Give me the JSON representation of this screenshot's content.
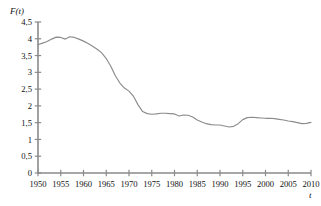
{
  "chart_data": {
    "type": "line",
    "title": "",
    "subtitle": "",
    "xlabel": "t",
    "ylabel": "F(t)",
    "xlim": [
      1950,
      2010
    ],
    "ylim": [
      0,
      4.5
    ],
    "grid": false,
    "legend": null,
    "x_tick_labels": [
      "1950",
      "1955",
      "1960",
      "1965",
      "1970",
      "1975",
      "1980",
      "1985",
      "1990",
      "1995",
      "2000",
      "2005",
      "2010"
    ],
    "x_tick_values": [
      1950,
      1955,
      1960,
      1965,
      1970,
      1975,
      1980,
      1985,
      1990,
      1995,
      2000,
      2005,
      2010
    ],
    "y_tick_labels": [
      "0",
      "0,5",
      "1",
      "1,5",
      "2",
      "2,5",
      "3",
      "3,5",
      "4",
      "4,5"
    ],
    "y_tick_values": [
      0,
      0.5,
      1,
      1.5,
      2,
      2.5,
      3,
      3.5,
      4,
      4.5
    ],
    "decimal_separator": ",",
    "line_color": "#8c8c8c",
    "axis_color": "#8a8a8a",
    "series": [
      {
        "name": "F(t)",
        "x": [
          1950,
          1951,
          1952,
          1953,
          1954,
          1955,
          1956,
          1957,
          1958,
          1959,
          1960,
          1961,
          1962,
          1963,
          1964,
          1965,
          1966,
          1967,
          1968,
          1969,
          1970,
          1971,
          1972,
          1973,
          1974,
          1975,
          1976,
          1977,
          1978,
          1979,
          1980,
          1981,
          1982,
          1983,
          1984,
          1985,
          1986,
          1987,
          1988,
          1989,
          1990,
          1991,
          1992,
          1993,
          1994,
          1995,
          1996,
          1997,
          1998,
          1999,
          2000,
          2001,
          2002,
          2003,
          2004,
          2005,
          2006,
          2007,
          2008,
          2009,
          2010
        ],
        "y": [
          3.82,
          3.87,
          3.92,
          3.99,
          4.05,
          4.04,
          3.99,
          4.06,
          4.04,
          3.99,
          3.93,
          3.86,
          3.78,
          3.69,
          3.58,
          3.41,
          3.18,
          2.9,
          2.68,
          2.53,
          2.44,
          2.28,
          2.03,
          1.83,
          1.77,
          1.75,
          1.76,
          1.78,
          1.78,
          1.77,
          1.76,
          1.7,
          1.73,
          1.72,
          1.67,
          1.58,
          1.52,
          1.47,
          1.44,
          1.43,
          1.43,
          1.4,
          1.37,
          1.39,
          1.47,
          1.59,
          1.65,
          1.66,
          1.65,
          1.64,
          1.63,
          1.63,
          1.62,
          1.6,
          1.58,
          1.55,
          1.53,
          1.5,
          1.47,
          1.48,
          1.51
        ]
      }
    ],
    "annotations": []
  }
}
